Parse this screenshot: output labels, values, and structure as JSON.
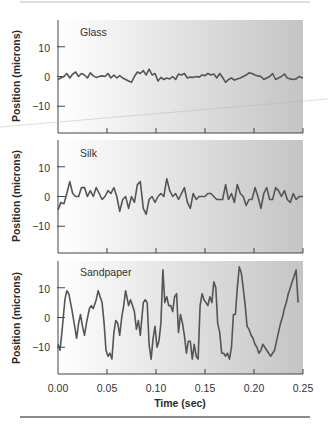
{
  "chart_data": [
    {
      "type": "line",
      "title": "Glass",
      "xlabel": "",
      "ylabel": "Position (microns)",
      "xlim": [
        0.0,
        0.25
      ],
      "ylim": [
        -19,
        19
      ],
      "yticks": [
        10,
        0,
        -10
      ],
      "ytick_labels": [
        "10",
        "0",
        "−10"
      ],
      "grid": false,
      "series": [
        {
          "name": "Glass",
          "x": [
            0.0,
            0.003,
            0.006,
            0.009,
            0.012,
            0.015,
            0.018,
            0.021,
            0.024,
            0.027,
            0.03,
            0.033,
            0.036,
            0.039,
            0.042,
            0.045,
            0.048,
            0.051,
            0.054,
            0.057,
            0.06,
            0.063,
            0.066,
            0.069,
            0.072,
            0.075,
            0.078,
            0.081,
            0.084,
            0.087,
            0.09,
            0.093,
            0.096,
            0.099,
            0.102,
            0.105,
            0.108,
            0.111,
            0.114,
            0.117,
            0.12,
            0.123,
            0.126,
            0.129,
            0.132,
            0.135,
            0.138,
            0.141,
            0.144,
            0.147,
            0.15,
            0.153,
            0.156,
            0.159,
            0.162,
            0.165,
            0.168,
            0.171,
            0.174,
            0.177,
            0.18,
            0.183,
            0.186,
            0.189,
            0.192,
            0.195,
            0.198,
            0.201,
            0.204,
            0.207,
            0.21,
            0.213,
            0.216,
            0.219,
            0.222,
            0.225,
            0.228,
            0.231,
            0.234,
            0.237,
            0.24,
            0.243,
            0.246,
            0.25
          ],
          "values": [
            -1,
            -0.5,
            0,
            1,
            -0.5,
            0.8,
            1.5,
            0,
            1,
            0.5,
            -0.5,
            1.2,
            0.2,
            -0.3,
            0,
            0.2,
            0,
            1,
            -0.5,
            0.5,
            -0.5,
            0.3,
            -0.5,
            -1,
            -1.5,
            -2,
            0,
            1.5,
            1,
            2,
            0.5,
            2.5,
            0.5,
            1,
            -1.5,
            -0.3,
            -1,
            -0.5,
            -0.8,
            0,
            -1,
            0.8,
            0.5,
            1,
            -0.5,
            -0.2,
            -0.3,
            0,
            -0.2,
            0.5,
            0.3,
            1,
            0.5,
            0.8,
            -0.5,
            1,
            -0.3,
            -2,
            -1,
            -0.5,
            -1.2,
            -0.8,
            -0.5,
            0,
            0.5,
            1.2,
            1,
            0.5,
            0.2,
            0,
            -1,
            -0.5,
            0,
            1,
            -1,
            -0.5,
            0,
            0.8,
            -0.5,
            -0.8,
            -1,
            -0.8,
            0,
            -0.5
          ]
        }
      ]
    },
    {
      "type": "line",
      "title": "Silk",
      "xlabel": "",
      "ylabel": "Position (microns)",
      "xlim": [
        0.0,
        0.25
      ],
      "ylim": [
        -19,
        19
      ],
      "yticks": [
        10,
        0,
        -10
      ],
      "ytick_labels": [
        "10",
        "0",
        "−10"
      ],
      "grid": false,
      "series": [
        {
          "name": "Silk",
          "x": [
            0.0,
            0.003,
            0.006,
            0.009,
            0.012,
            0.015,
            0.018,
            0.021,
            0.024,
            0.027,
            0.03,
            0.033,
            0.036,
            0.039,
            0.042,
            0.045,
            0.048,
            0.051,
            0.054,
            0.057,
            0.06,
            0.063,
            0.066,
            0.069,
            0.072,
            0.075,
            0.078,
            0.081,
            0.084,
            0.087,
            0.09,
            0.093,
            0.096,
            0.099,
            0.102,
            0.105,
            0.108,
            0.111,
            0.114,
            0.117,
            0.12,
            0.123,
            0.126,
            0.129,
            0.132,
            0.135,
            0.138,
            0.141,
            0.144,
            0.147,
            0.15,
            0.153,
            0.156,
            0.159,
            0.162,
            0.165,
            0.168,
            0.171,
            0.174,
            0.177,
            0.18,
            0.183,
            0.186,
            0.189,
            0.192,
            0.195,
            0.198,
            0.201,
            0.204,
            0.207,
            0.21,
            0.213,
            0.216,
            0.219,
            0.222,
            0.225,
            0.228,
            0.231,
            0.234,
            0.237,
            0.24,
            0.243,
            0.246,
            0.25
          ],
          "values": [
            -4.5,
            -2,
            -2.5,
            1,
            5,
            1,
            0,
            0,
            3,
            3,
            0,
            2,
            0,
            3,
            1,
            -1,
            0,
            2,
            1,
            3,
            0,
            -5,
            -1,
            0,
            -4,
            0,
            -2,
            4,
            5,
            -4,
            -6,
            -1,
            0,
            -2,
            0,
            1,
            0,
            6,
            2,
            0,
            1,
            -1,
            1,
            3,
            -2,
            -4,
            1,
            -1,
            0,
            0,
            0,
            1,
            1,
            0,
            -1,
            -1,
            -1,
            4,
            -1,
            1,
            -2,
            4,
            1,
            0,
            -3,
            -1,
            -1,
            3,
            0,
            -4,
            1,
            3,
            -1,
            -1,
            3,
            2,
            0,
            2,
            -1,
            -2,
            1,
            -1,
            0,
            0
          ]
        }
      ]
    },
    {
      "type": "line",
      "title": "Sandpaper",
      "xlabel": "Time (sec)",
      "ylabel": "Position (microns)",
      "xlim": [
        0.0,
        0.25
      ],
      "ylim": [
        -19,
        19
      ],
      "xticks": [
        0.0,
        0.05,
        0.1,
        0.15,
        0.2,
        0.25
      ],
      "xtick_labels": [
        "0.00",
        "0.05",
        "0.10",
        "0.15",
        "0.20",
        "0.25"
      ],
      "yticks": [
        10,
        0,
        -10
      ],
      "ytick_labels": [
        "10",
        "0",
        "−10"
      ],
      "grid": false,
      "series": [
        {
          "name": "Sandpaper",
          "x": [
            0.0,
            0.002,
            0.004,
            0.007,
            0.009,
            0.011,
            0.014,
            0.017,
            0.019,
            0.021,
            0.023,
            0.025,
            0.027,
            0.029,
            0.032,
            0.034,
            0.036,
            0.039,
            0.041,
            0.043,
            0.045,
            0.047,
            0.049,
            0.051,
            0.053,
            0.055,
            0.057,
            0.059,
            0.061,
            0.063,
            0.065,
            0.067,
            0.069,
            0.072,
            0.074,
            0.076,
            0.078,
            0.08,
            0.082,
            0.084,
            0.087,
            0.089,
            0.091,
            0.093,
            0.095,
            0.097,
            0.099,
            0.101,
            0.103,
            0.105,
            0.107,
            0.109,
            0.111,
            0.113,
            0.115,
            0.117,
            0.119,
            0.121,
            0.123,
            0.125,
            0.127,
            0.129,
            0.131,
            0.133,
            0.135,
            0.137,
            0.139,
            0.141,
            0.143,
            0.145,
            0.147,
            0.149,
            0.151,
            0.153,
            0.155,
            0.157,
            0.159,
            0.161,
            0.163,
            0.165,
            0.167,
            0.169,
            0.171,
            0.173,
            0.175,
            0.177,
            0.179,
            0.181,
            0.183,
            0.185,
            0.187,
            0.189,
            0.191,
            0.193,
            0.195,
            0.197,
            0.199,
            0.201,
            0.203,
            0.205,
            0.207,
            0.209,
            0.211,
            0.213,
            0.215,
            0.217,
            0.219,
            0.221,
            0.223,
            0.225,
            0.227,
            0.229,
            0.231,
            0.233,
            0.235,
            0.237,
            0.239,
            0.241,
            0.243,
            0.245,
            0.247,
            0.25
          ],
          "values": [
            -9,
            -11,
            -5,
            6,
            9,
            8,
            3,
            -3,
            -7,
            -2,
            1,
            -3,
            -6,
            -2,
            3,
            4,
            3,
            6,
            9,
            7,
            5,
            -2,
            -11,
            -13,
            -12,
            -14,
            -5,
            -1,
            -2,
            -6,
            0,
            4,
            9,
            4,
            6,
            4,
            2,
            -4,
            -1,
            -6,
            5,
            6,
            5,
            -9,
            -14,
            -7,
            -3,
            -10,
            -8,
            -2,
            16,
            5,
            7,
            4,
            4,
            2,
            7,
            8,
            -5,
            1,
            -2,
            -6,
            -12,
            -8,
            -8,
            -14,
            -9,
            -13,
            -14,
            4,
            8,
            6,
            5,
            4,
            7,
            5,
            12,
            10,
            -2,
            -5,
            -12,
            -12,
            -13,
            -12,
            -14,
            -10,
            1,
            1,
            10,
            17,
            15,
            10,
            4,
            -3,
            -4,
            -6,
            -7,
            -9,
            -10,
            -12,
            -11,
            -9,
            -10,
            -11,
            -12,
            -13,
            -12,
            -11,
            -8,
            -5,
            -2,
            0,
            3,
            5,
            8,
            10,
            12,
            14,
            16,
            5
          ]
        }
      ]
    }
  ],
  "figure": {
    "line_color": "#555555",
    "panel_fill_left": "#ffffff",
    "panel_fill_right": "#c7c7c7",
    "axis_color": "#444444",
    "rule_top_color": "#d8d8d8",
    "rule_bottom_color": "#8a8a8a"
  }
}
